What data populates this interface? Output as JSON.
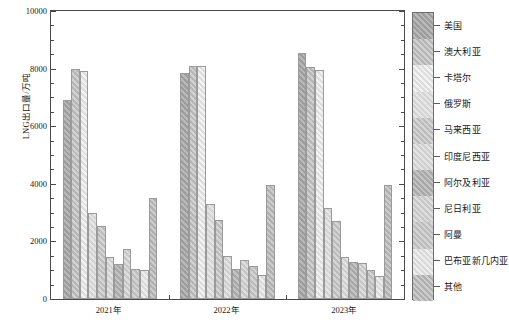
{
  "chart_data": {
    "type": "bar",
    "title": "",
    "subtitle": "",
    "xlabel": "",
    "ylabel": "LNG出口量/万吨",
    "categories": [
      "2021年",
      "2022年",
      "2023年"
    ],
    "ylim": [
      0,
      10000
    ],
    "ytick_labels": [
      "0",
      "2000",
      "4000",
      "6000",
      "8000",
      "10000"
    ],
    "ytick_values": [
      0,
      2000,
      4000,
      6000,
      8000,
      10000
    ],
    "yminor_step": 500,
    "grid": false,
    "legend_position": "right",
    "series": [
      {
        "name": "美国",
        "values": [
          6900,
          7850,
          8550
        ]
      },
      {
        "name": "澳大利亚",
        "values": [
          8000,
          8100,
          8050
        ]
      },
      {
        "name": "卡塔尔",
        "values": [
          7900,
          8100,
          7950
        ]
      },
      {
        "name": "俄罗斯",
        "values": [
          3000,
          3300,
          3150
        ]
      },
      {
        "name": "马来西亚",
        "values": [
          2550,
          2750,
          2700
        ]
      },
      {
        "name": "印度尼西亚",
        "values": [
          1450,
          1500,
          1450
        ]
      },
      {
        "name": "阿尔及利亚",
        "values": [
          1200,
          1050,
          1300
        ]
      },
      {
        "name": "尼日利亚",
        "values": [
          1750,
          1350,
          1250
        ]
      },
      {
        "name": "阿曼",
        "values": [
          1050,
          1150,
          1000
        ]
      },
      {
        "name": "巴布亚新几内亚",
        "values": [
          1000,
          850,
          800
        ]
      },
      {
        "name": "其他",
        "values": [
          3500,
          3950,
          3950
        ]
      }
    ]
  },
  "colors": {
    "axis": "#4a4a4a",
    "text": "#1a1a1a",
    "bar_edge": "#9a9a9a",
    "background": "#ffffff"
  }
}
